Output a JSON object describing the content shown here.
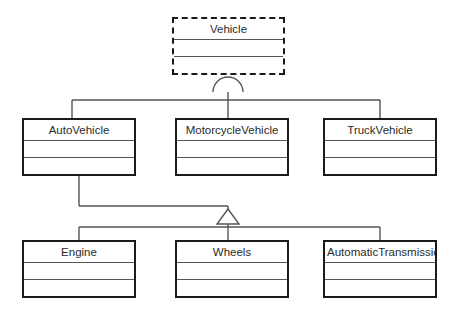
{
  "diagram": {
    "notation": "UML class diagram",
    "background_color": "#ffffff",
    "line_color": "#555555",
    "box_border_color": "#1a1a1a",
    "text_color": "#2b2b2b"
  },
  "classes": [
    {
      "id": "vehicle",
      "name": "Vehicle",
      "abstract": true,
      "border_style": "dashed",
      "x": 172,
      "y": 17,
      "w": 113,
      "h": 58,
      "attributes": "",
      "operations": ""
    },
    {
      "id": "autovehicle",
      "name": "AutoVehicle",
      "abstract": false,
      "border_style": "solid",
      "x": 22,
      "y": 118,
      "w": 114,
      "h": 58,
      "attributes": "",
      "operations": ""
    },
    {
      "id": "motorcyclevehicle",
      "name": "MotorcycleVehicle",
      "abstract": false,
      "border_style": "solid",
      "x": 175,
      "y": 118,
      "w": 114,
      "h": 58,
      "attributes": "",
      "operations": ""
    },
    {
      "id": "truckvehicle",
      "name": "TruckVehicle",
      "abstract": false,
      "border_style": "solid",
      "x": 323,
      "y": 118,
      "w": 114,
      "h": 58,
      "attributes": "",
      "operations": ""
    },
    {
      "id": "engine",
      "name": "Engine",
      "abstract": false,
      "border_style": "solid",
      "x": 22,
      "y": 240,
      "w": 114,
      "h": 58,
      "attributes": "",
      "operations": ""
    },
    {
      "id": "wheels",
      "name": "Wheels",
      "abstract": false,
      "border_style": "solid",
      "x": 175,
      "y": 240,
      "w": 114,
      "h": 58,
      "attributes": "",
      "operations": ""
    },
    {
      "id": "automatictransmission",
      "name": "AutomaticTransmission",
      "abstract": false,
      "border_style": "solid",
      "x": 323,
      "y": 240,
      "w": 114,
      "h": 58,
      "attributes": "",
      "operations": ""
    }
  ],
  "relationships": [
    {
      "id": "rel-vehicle-generalization",
      "type": "generalization",
      "arrowhead": "arc",
      "parent": "Vehicle",
      "children": [
        "AutoVehicle",
        "MotorcycleVehicle",
        "TruckVehicle"
      ]
    },
    {
      "id": "rel-autovehicle-generalization",
      "type": "generalization",
      "arrowhead": "hollow-triangle",
      "parent": "AutoVehicle",
      "children": [
        "Engine",
        "Wheels",
        "AutomaticTransmission"
      ]
    }
  ]
}
